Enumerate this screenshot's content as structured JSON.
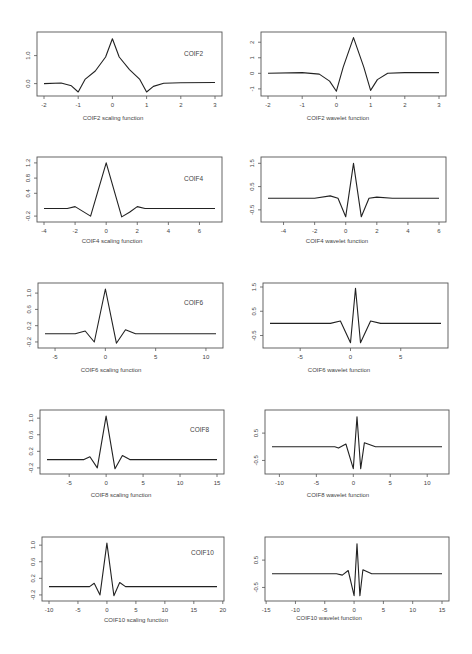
{
  "chart_data": [
    {
      "id": "coif2-scaling",
      "type": "line",
      "title": "COIF2",
      "xlabel": "COIF2 scaling function",
      "ylabel": "",
      "xlim": [
        -2,
        3
      ],
      "ylim": [
        -0.3,
        1.7
      ],
      "xticks": [
        -2,
        -1,
        0,
        1,
        2,
        3
      ],
      "yticks": [
        0.0,
        1.0
      ],
      "ytick_labels": [
        "0.0",
        "1.0"
      ],
      "x": [
        -2,
        -1.5,
        -1.2,
        -1.0,
        -0.8,
        -0.5,
        -0.2,
        0,
        0.2,
        0.5,
        0.8,
        1.0,
        1.2,
        1.5,
        2,
        3
      ],
      "y": [
        0,
        0.02,
        -0.08,
        -0.3,
        0.15,
        0.45,
        0.95,
        1.6,
        0.95,
        0.5,
        0.15,
        -0.3,
        -0.1,
        0.01,
        0.03,
        0.04
      ]
    },
    {
      "id": "coif2-wavelet",
      "type": "line",
      "title": "",
      "xlabel": "COIF2 wavelet function",
      "ylabel": "",
      "xlim": [
        -2,
        3
      ],
      "ylim": [
        -1.2,
        2.4
      ],
      "xticks": [
        -2,
        -1,
        0,
        1,
        2,
        3
      ],
      "yticks": [
        -1,
        0,
        1,
        2
      ],
      "ytick_labels": [
        "-1",
        "0",
        "1",
        "2"
      ],
      "x": [
        -2,
        -1,
        -0.5,
        -0.2,
        0,
        0.2,
        0.5,
        0.8,
        1.0,
        1.2,
        1.5,
        2,
        3
      ],
      "y": [
        0,
        0.05,
        -0.05,
        -0.5,
        -1.15,
        0.4,
        2.3,
        0.4,
        -1.1,
        -0.4,
        0,
        0.05,
        0.05
      ]
    },
    {
      "id": "coif4-scaling",
      "type": "line",
      "title": "COIF4",
      "xlabel": "COIF4 scaling function",
      "ylabel": "",
      "xlim": [
        -4,
        7
      ],
      "ylim": [
        -0.25,
        1.25
      ],
      "xticks": [
        -4,
        -2,
        0,
        2,
        4,
        6
      ],
      "yticks": [
        -0.2,
        0.4,
        0.8,
        1.2
      ],
      "ytick_labels": [
        "-0.2",
        "0.4",
        "0.8",
        "1.2"
      ],
      "x": [
        -4,
        -2.5,
        -2,
        -1,
        0,
        1,
        1.5,
        2,
        2.5,
        7
      ],
      "y": [
        0,
        0,
        0.05,
        -0.2,
        1.2,
        -0.22,
        -0.1,
        0.05,
        0,
        0
      ]
    },
    {
      "id": "coif4-wavelet",
      "type": "line",
      "title": "",
      "xlabel": "COIF4 wavelet function",
      "ylabel": "",
      "xlim": [
        -5,
        6
      ],
      "ylim": [
        -0.85,
        1.6
      ],
      "xticks": [
        -4,
        -2,
        0,
        2,
        4,
        6
      ],
      "yticks": [
        -0.5,
        0.5,
        1.5
      ],
      "ytick_labels": [
        "-0.5",
        "0.5",
        "1.5"
      ],
      "x": [
        -5,
        -2,
        -1,
        -0.5,
        0,
        0.5,
        1,
        1.5,
        2,
        3,
        6
      ],
      "y": [
        0,
        0,
        0.1,
        0,
        -0.8,
        1.5,
        -0.8,
        0,
        0.05,
        0,
        0
      ]
    },
    {
      "id": "coif6-scaling",
      "type": "line",
      "title": "COIF6",
      "xlabel": "COIF6 scaling function",
      "ylabel": "",
      "xlim": [
        -6,
        11
      ],
      "ylim": [
        -0.25,
        1.15
      ],
      "xticks": [
        -5,
        0,
        5,
        10
      ],
      "yticks": [
        -0.2,
        0.2,
        0.6,
        1.0
      ],
      "ytick_labels": [
        "-0.2",
        "0.2",
        "0.6",
        "1.0"
      ],
      "x": [
        -6,
        -3,
        -2,
        -1.1,
        0,
        1.1,
        2,
        3,
        11
      ],
      "y": [
        0,
        0,
        0.07,
        -0.2,
        1.1,
        -0.23,
        0.1,
        0,
        0
      ]
    },
    {
      "id": "coif6-wavelet",
      "type": "line",
      "title": "",
      "xlabel": "COIF6 wavelet function",
      "ylabel": "",
      "xlim": [
        -8,
        9
      ],
      "ylim": [
        -0.85,
        1.5
      ],
      "xticks": [
        -5,
        0,
        5
      ],
      "yticks": [
        -0.5,
        0.5,
        1.5
      ],
      "ytick_labels": [
        "-0.5",
        "0.5",
        "1.5"
      ],
      "x": [
        -8,
        -2,
        -1,
        0,
        0.5,
        1,
        2,
        3,
        9
      ],
      "y": [
        0,
        0,
        0.1,
        -0.8,
        1.45,
        -0.8,
        0.1,
        0,
        0
      ]
    },
    {
      "id": "coif8-scaling",
      "type": "line",
      "title": "COIF8",
      "xlabel": "COIF8 scaling function",
      "ylabel": "",
      "xlim": [
        -8,
        15
      ],
      "ylim": [
        -0.25,
        1.1
      ],
      "xticks": [
        -5,
        0,
        5,
        10,
        15
      ],
      "yticks": [
        -0.2,
        0.2,
        0.6,
        1.0
      ],
      "ytick_labels": [
        "-0.2",
        "0.2",
        "0.6",
        "1.0"
      ],
      "x": [
        -8,
        -3,
        -2.2,
        -1.2,
        0,
        1.2,
        2.2,
        3.2,
        15
      ],
      "y": [
        0,
        0,
        0.07,
        -0.2,
        1.05,
        -0.22,
        0.1,
        0,
        0
      ]
    },
    {
      "id": "coif8-wavelet",
      "type": "line",
      "title": "",
      "xlabel": "COIF8 wavelet function",
      "ylabel": "",
      "xlim": [
        -11,
        12
      ],
      "ylim": [
        -0.85,
        1.2
      ],
      "xticks": [
        -10,
        -5,
        0,
        5,
        10
      ],
      "yticks": [
        -0.5,
        0.5
      ],
      "ytick_labels": [
        "-0.5",
        "0.5"
      ],
      "x": [
        -11,
        -2.5,
        -2,
        -1,
        0,
        0.5,
        1,
        1.5,
        3,
        12
      ],
      "y": [
        0,
        0,
        -0.05,
        0.1,
        -0.8,
        1.1,
        -0.8,
        0.15,
        0,
        0
      ]
    },
    {
      "id": "coif10-scaling",
      "type": "line",
      "title": "COIF10",
      "xlabel": "COIF10 scaling function",
      "ylabel": "",
      "xlim": [
        -10,
        19
      ],
      "ylim": [
        -0.25,
        1.1
      ],
      "xticks": [
        -10,
        -5,
        0,
        5,
        10,
        15,
        20
      ],
      "yticks": [
        -0.2,
        0.2,
        0.6,
        1.0
      ],
      "ytick_labels": [
        "-0.2",
        "0.2",
        "0.6",
        "1.0"
      ],
      "x": [
        -10,
        -3,
        -2.2,
        -1.2,
        0,
        1.2,
        2.2,
        3.2,
        19
      ],
      "y": [
        0,
        0,
        0.08,
        -0.2,
        1.05,
        -0.22,
        0.1,
        0,
        0
      ]
    },
    {
      "id": "coif10-wavelet",
      "type": "line",
      "title": "",
      "xlabel": "COIF10 wavelet function",
      "ylabel": "",
      "xlim": [
        -14,
        15
      ],
      "ylim": [
        -0.85,
        1.2
      ],
      "xticks": [
        -15,
        -10,
        -5,
        0,
        5,
        10,
        15
      ],
      "yticks": [
        -0.5,
        0.5
      ],
      "ytick_labels": [
        "-0.5",
        "0.5"
      ],
      "x": [
        -14,
        -3,
        -2,
        -1,
        0,
        0.5,
        1,
        1.5,
        3,
        15
      ],
      "y": [
        0,
        0,
        -0.05,
        0.12,
        -0.8,
        1.1,
        -0.8,
        0.15,
        0,
        0
      ]
    }
  ],
  "panels": [
    {
      "legend": "COIF2",
      "caption": "COIF2 scaling function"
    },
    {
      "legend": "",
      "caption": "COIF2 wavelet function"
    },
    {
      "legend": "COIF4",
      "caption": "COIF4 scaling function"
    },
    {
      "legend": "",
      "caption": "COIF4 wavelet function"
    },
    {
      "legend": "COIF6",
      "caption": "COIF6 scaling function"
    },
    {
      "legend": "",
      "caption": "COIF6 wavelet function"
    },
    {
      "legend": "COIF8",
      "caption": "COIF8 scaling function"
    },
    {
      "legend": "",
      "caption": "COIF8 wavelet function"
    },
    {
      "legend": "COIF10",
      "caption": "COIF10 scaling function"
    },
    {
      "legend": "",
      "caption": "COIF10 wavelet function"
    }
  ]
}
